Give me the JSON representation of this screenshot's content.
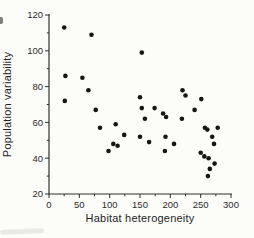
{
  "figure": {
    "kind": "scanned-scatter-plot-figure",
    "title": ""
  },
  "colors": {
    "marker": "#161616",
    "axis": "#2e2e2e",
    "text": "#262626",
    "background": "#fcfcf9"
  },
  "chart_data": {
    "type": "scatter",
    "title": "",
    "xlabel": "Habitat heterogeneity",
    "ylabel": "Population variability",
    "xlim": [
      0,
      300
    ],
    "ylim": [
      20,
      120
    ],
    "xticks": [
      0,
      50,
      100,
      150,
      200,
      250,
      300
    ],
    "yticks": [
      20,
      40,
      60,
      80,
      100,
      120
    ],
    "x_minor_step": 25,
    "y_minor_step": 10,
    "grid": false,
    "legend": null,
    "marker": {
      "shape": "circle",
      "radius": 2.3
    },
    "points": [
      [
        25,
        113
      ],
      [
        70,
        109
      ],
      [
        27,
        86
      ],
      [
        55,
        85
      ],
      [
        65,
        78
      ],
      [
        26,
        72
      ],
      [
        77,
        67
      ],
      [
        84,
        57
      ],
      [
        110,
        59
      ],
      [
        124,
        53
      ],
      [
        106,
        48
      ],
      [
        113,
        47
      ],
      [
        98,
        44
      ],
      [
        153,
        99
      ],
      [
        150,
        74
      ],
      [
        153,
        68
      ],
      [
        174,
        68
      ],
      [
        158,
        62
      ],
      [
        188,
        65
      ],
      [
        193,
        63
      ],
      [
        219,
        62
      ],
      [
        150,
        52
      ],
      [
        165,
        49
      ],
      [
        192,
        52
      ],
      [
        206,
        48
      ],
      [
        191,
        44
      ],
      [
        220,
        78
      ],
      [
        225,
        75
      ],
      [
        251,
        73
      ],
      [
        240,
        67
      ],
      [
        257,
        57
      ],
      [
        261,
        56
      ],
      [
        278,
        57
      ],
      [
        269,
        52
      ],
      [
        272,
        48
      ],
      [
        250,
        43
      ],
      [
        256,
        41
      ],
      [
        263,
        40
      ],
      [
        273,
        37
      ],
      [
        265,
        34
      ],
      [
        262,
        30
      ]
    ]
  }
}
